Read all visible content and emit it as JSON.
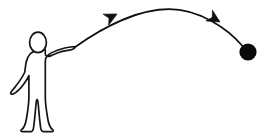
{
  "scene": {
    "title": "Stick figure throwing a ball along a curved trajectory",
    "width": 274,
    "height": 139,
    "background_color": "#ffffff",
    "ink_color": "#101010"
  },
  "figure": {
    "name": "stick-person",
    "head": {
      "cx": 38,
      "cy": 42.5,
      "rx": 8.5,
      "ry": 10
    },
    "outline_points": "30,52 27,58 25,68 18,80 13,88 11,92 14,94 20,90 26,82 29,76 29,96 26,112 24,124 19,129 20,131 30,129 33,120 35,108 37,100 39,108 41,120 44,129 54,131 55,129 50,124 48,112 46,96 46,58 54,50 62,46 70,45 73,47 74,49 72,50 64,50 58,53 50,55 46,56",
    "pointing_hand_tip": {
      "x": 74,
      "y": 47
    },
    "lowered_hand_tip": {
      "x": 11,
      "y": 92
    }
  },
  "trajectory": {
    "name": "projectile-arc",
    "path_d": "M 74 47 C 105 25, 140 9, 170 10 C 200 11, 228 28, 243 46",
    "start": {
      "x": 74,
      "y": 47
    },
    "apex": {
      "x": 167,
      "y": 9
    },
    "end": {
      "x": 243,
      "y": 46
    },
    "direction": "left-to-right, rising then falling (parabolic)"
  },
  "arrowheads": [
    {
      "name": "trajectory-arrowhead-ascending",
      "tip": {
        "x": 117,
        "y": 14
      },
      "angle_deg": -27,
      "size": 11
    },
    {
      "name": "trajectory-arrowhead-descending",
      "tip": {
        "x": 219,
        "y": 21
      },
      "angle_deg": 30,
      "size": 11
    }
  ],
  "ball": {
    "name": "projectile-ball",
    "cx": 248,
    "cy": 52,
    "r": 8.5,
    "color": "#0a0a0a"
  }
}
